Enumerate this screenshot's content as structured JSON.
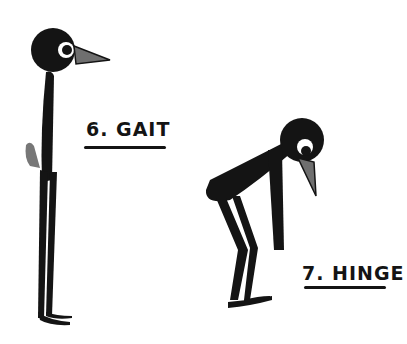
{
  "illustration": {
    "figures": [
      {
        "name": "gait",
        "label": "6. GAIT"
      },
      {
        "name": "hinge",
        "label": "7. HINGE"
      }
    ],
    "colors": {
      "ink": "#141414",
      "beak": "#6f6f6f",
      "background": "#ffffff"
    }
  }
}
